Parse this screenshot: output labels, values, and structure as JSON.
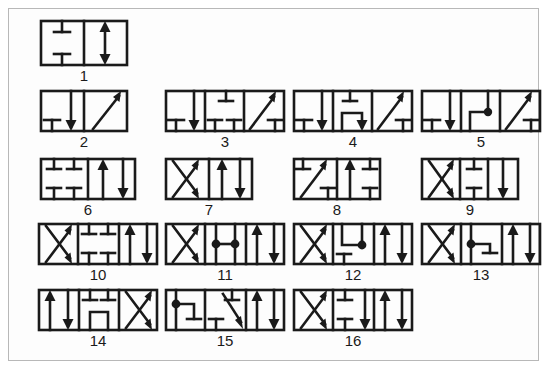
{
  "figure": {
    "frame_color": "#b8b8b8",
    "background_color": "#fdfdfd",
    "line_color": "#1a1a1a",
    "symbol_count": 16
  },
  "symbols": [
    {
      "label": "1",
      "positions": 2,
      "box_width": 44,
      "box_height": 45,
      "x": 38,
      "y": 18,
      "cells": [
        {
          "type": "blocked-pair",
          "desc": "T top and T bottom, ports blocked"
        },
        {
          "type": "double-arrow",
          "desc": "up arrow and down arrow"
        }
      ]
    },
    {
      "label": "2",
      "positions": 2,
      "box_width": 44,
      "box_height": 40,
      "x": 38,
      "y": 88,
      "cells": [
        {
          "type": "t-left-down-arrow",
          "desc": "blocked T left, down arrow right"
        },
        {
          "type": "diagonal-up",
          "desc": "diagonal arrow up-right"
        }
      ]
    },
    {
      "label": "3",
      "positions": 3,
      "box_width": 40,
      "box_height": 40,
      "x": 163,
      "y": 88,
      "cells": [
        {
          "type": "t-left-down-arrow",
          "desc": "blocked T left, down arrow right"
        },
        {
          "type": "t-two-bottom-one-top",
          "desc": "two T bottom, one T top"
        },
        {
          "type": "diagonal-up-t",
          "desc": "diagonal arrow up-right with T bottom-right"
        }
      ]
    },
    {
      "label": "4",
      "positions": 3,
      "box_width": 40,
      "box_height": 40,
      "x": 291,
      "y": 88,
      "cells": [
        {
          "type": "t-left-down-arrow",
          "desc": "blocked T left, down arrow right"
        },
        {
          "type": "bridge-t-top-down-arrow",
          "desc": "T top, U bridge into down arrow"
        },
        {
          "type": "diagonal-up-t",
          "desc": "diagonal arrow up-right with T bottom-right"
        }
      ]
    },
    {
      "label": "5",
      "positions": 3,
      "box_width": 40,
      "box_height": 40,
      "x": 419,
      "y": 88,
      "cells": [
        {
          "type": "t-left-down-arrow",
          "desc": "blocked T left, down arrow right"
        },
        {
          "type": "elbow-dot",
          "desc": "L elbow junction with filled dot"
        },
        {
          "type": "diagonal-up-t",
          "desc": "diagonal arrow up-right with T bottom-right"
        }
      ]
    },
    {
      "label": "6",
      "positions": 2,
      "box_width": 48,
      "box_height": 40,
      "x": 38,
      "y": 155,
      "cells": [
        {
          "type": "four-t",
          "desc": "two T top, two T bottom, all ports blocked"
        },
        {
          "type": "up-down-arrows",
          "desc": "up arrow and down arrow"
        }
      ]
    },
    {
      "label": "7",
      "positions": 2,
      "box_width": 44,
      "box_height": 40,
      "x": 163,
      "y": 155,
      "cells": [
        {
          "type": "crossed-arrows",
          "desc": "X crossed flow arrows"
        },
        {
          "type": "up-down-arrows",
          "desc": "up arrow and down arrow"
        }
      ]
    },
    {
      "label": "8",
      "positions": 2,
      "box_width": 44,
      "box_height": 40,
      "x": 291,
      "y": 155,
      "cells": [
        {
          "type": "t-diagonal-t",
          "desc": "T top-left, diagonal up arrow, T bottom-right"
        },
        {
          "type": "up-arrow-two-t",
          "desc": "up arrow with T top and T bottom"
        }
      ]
    },
    {
      "label": "9",
      "positions": 3,
      "box_width": 33,
      "box_height": 40,
      "x": 419,
      "y": 155,
      "cells": [
        {
          "type": "crossed-arrows",
          "desc": "X crossed flow arrows"
        },
        {
          "type": "t-top-t-bottom",
          "desc": "T top and T bottom blocked"
        },
        {
          "type": "down-arrow",
          "desc": "down arrow"
        }
      ]
    },
    {
      "label": "10",
      "positions": 3,
      "box_width": 40,
      "box_height": 40,
      "x": 36,
      "y": 220,
      "cells": [
        {
          "type": "crossed-arrows",
          "desc": "X crossed flow arrows"
        },
        {
          "type": "four-t",
          "desc": "two T top, two T bottom, all ports blocked"
        },
        {
          "type": "up-down-arrows",
          "desc": "up arrow and down arrow"
        }
      ]
    },
    {
      "label": "11",
      "positions": 3,
      "box_width": 40,
      "box_height": 40,
      "x": 163,
      "y": 220,
      "cells": [
        {
          "type": "crossed-arrows",
          "desc": "X crossed flow arrows"
        },
        {
          "type": "two-dots-link",
          "desc": "two junction dots joined by horizontal line"
        },
        {
          "type": "up-down-arrows",
          "desc": "up arrow and down arrow"
        }
      ]
    },
    {
      "label": "12",
      "positions": 3,
      "box_width": 40,
      "box_height": 40,
      "x": 291,
      "y": 220,
      "cells": [
        {
          "type": "elbow-dot-t",
          "desc": "elbow with dot on right, T bottom-left"
        },
        {
          "type": "crossed-arrows",
          "desc": "X crossed flow arrows"
        },
        {
          "type": "up-down-arrows",
          "desc": "up arrow and down arrow"
        }
      ]
    },
    {
      "label": "13",
      "positions": 3,
      "box_width": 40,
      "box_height": 40,
      "x": 419,
      "y": 220,
      "cells": [
        {
          "type": "crossed-arrows",
          "desc": "X crossed flow arrows"
        },
        {
          "type": "dot-elbow-t",
          "desc": "dot on left with elbow right, T bottom-right"
        },
        {
          "type": "up-down-arrows",
          "desc": "up arrow and down arrow"
        }
      ]
    },
    {
      "label": "14",
      "positions": 3,
      "box_width": 40,
      "box_height": 40,
      "x": 36,
      "y": 286,
      "cells": [
        {
          "type": "up-down-arrows",
          "desc": "up arrow and down arrow"
        },
        {
          "type": "two-t-top-bridge",
          "desc": "two T top with U bridge below"
        },
        {
          "type": "crossed-arrows",
          "desc": "X crossed flow arrows"
        }
      ]
    },
    {
      "label": "15",
      "positions": 3,
      "box_width": 40,
      "box_height": 40,
      "x": 163,
      "y": 286,
      "cells": [
        {
          "type": "dot-elbow-down",
          "desc": "dot left with elbow right into T bottom"
        },
        {
          "type": "t-top-diagonal-down",
          "desc": "T top, T bottom, diagonal down arrow"
        },
        {
          "type": "up-down-arrows",
          "desc": "up arrow and down arrow"
        }
      ]
    },
    {
      "label": "16",
      "positions": 3,
      "box_width": 40,
      "box_height": 40,
      "x": 291,
      "y": 286,
      "cells": [
        {
          "type": "crossed-arrows",
          "desc": "X crossed flow arrows"
        },
        {
          "type": "t-top-t-bottom-down-arrow",
          "desc": "T top, T bottom and down arrow"
        },
        {
          "type": "up-down-arrows",
          "desc": "up arrow and down arrow"
        }
      ]
    }
  ]
}
